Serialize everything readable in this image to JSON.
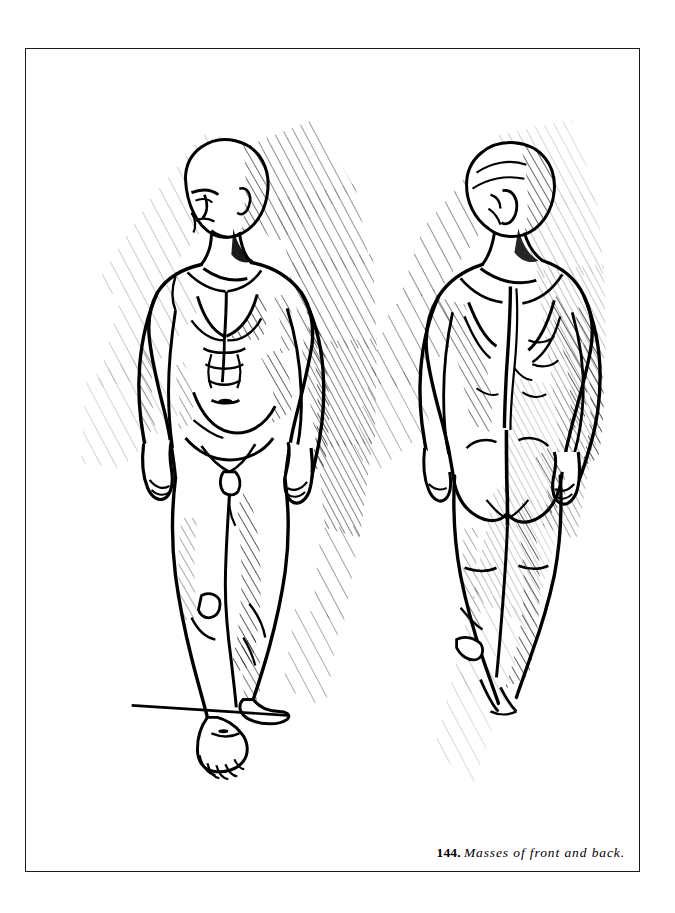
{
  "page": {
    "background_color": "#ffffff",
    "width": 675,
    "height": 913
  },
  "plate": {
    "border_color": "#1a1a1a",
    "fill_color": "#ffffff",
    "ink_color": "#000000"
  },
  "caption": {
    "figure_number": "144.",
    "text": "Masses of front and back."
  },
  "illustration": {
    "medium": "pen-and-ink line drawing with diagonal hatching",
    "subject": "two male anatomical figures",
    "figures": [
      {
        "id": "front-figure",
        "view": "front",
        "description": "Standing nude male seen from the front, head turned slightly to his right, arms hanging at the sides, weight on the forward leg, both feet visible on a ground line.",
        "visible_extent": "head to feet",
        "shading": "radiating diagonal hatching behind head, shoulders, torso and legs"
      },
      {
        "id": "back-figure",
        "view": "back",
        "description": "Standing nude male seen from behind, head turned to his left, shoulder blades and spinal furrow indicated, buttocks and upper legs modeled, cropped at the calves.",
        "visible_extent": "head to calves",
        "shading": "dense diagonal hatching behind head, back, buttocks and right side"
      }
    ],
    "ground_line": "short horizontal ink stroke beneath the front figure's feet"
  }
}
